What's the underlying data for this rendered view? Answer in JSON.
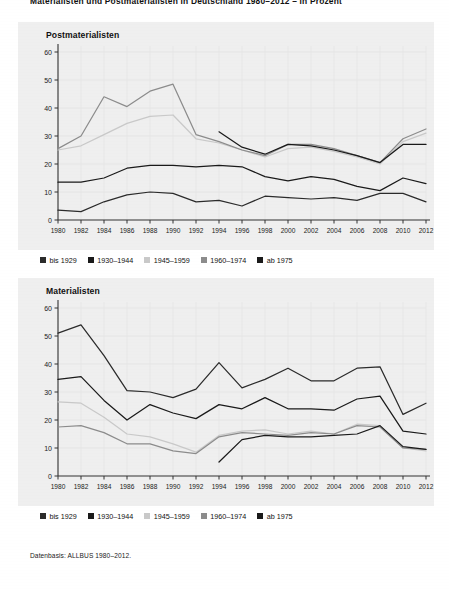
{
  "figure": {
    "title": "Materialisten und Postmaterialisten in Deutschland 1980–2012 – in Prozent",
    "source": "Datenbasis: ALLBUS 1980–2012."
  },
  "legend": {
    "items": [
      {
        "label": "bis 1929",
        "color": "#2b2b2b"
      },
      {
        "label": "1930–1944",
        "color": "#1a1a1a"
      },
      {
        "label": "1945–1959",
        "color": "#c9c9c9"
      },
      {
        "label": "1960–1974",
        "color": "#8c8c8c"
      },
      {
        "label": "ab 1975",
        "color": "#1a1a1a"
      }
    ]
  },
  "chart_data": [
    {
      "type": "line",
      "title": "Postmaterialisten",
      "xlabel": "",
      "ylabel": "",
      "ylim": [
        0,
        60
      ],
      "yticks": [
        0,
        10,
        20,
        30,
        40,
        50,
        60
      ],
      "grid": true,
      "legend_position": "below",
      "x": [
        1980,
        1982,
        1984,
        1986,
        1988,
        1990,
        1992,
        1994,
        1996,
        1998,
        2000,
        2002,
        2004,
        2006,
        2008,
        2010,
        2012
      ],
      "series": [
        {
          "name": "bis 1929",
          "color": "#2b2b2b",
          "values": [
            3.5,
            3.0,
            6.5,
            9.0,
            10.0,
            9.5,
            6.5,
            7.0,
            5.0,
            8.5,
            8.0,
            7.5,
            8.0,
            7.0,
            9.5,
            9.5,
            6.5
          ]
        },
        {
          "name": "1930–1944",
          "color": "#1a1a1a",
          "values": [
            13.5,
            13.5,
            15.0,
            18.5,
            19.5,
            19.5,
            19.0,
            19.5,
            19.0,
            15.5,
            14.0,
            15.5,
            14.5,
            12.0,
            10.5,
            15.0,
            13.0
          ]
        },
        {
          "name": "1945–1959",
          "color": "#c9c9c9",
          "values": [
            25.0,
            26.5,
            30.5,
            34.5,
            37.0,
            37.5,
            29.0,
            27.5,
            25.0,
            22.5,
            25.5,
            26.0,
            24.5,
            22.5,
            20.0,
            28.0,
            31.0
          ]
        },
        {
          "name": "1960–1974",
          "color": "#8c8c8c",
          "values": [
            25.5,
            30.0,
            44.0,
            40.5,
            46.0,
            48.5,
            30.5,
            28.0,
            25.0,
            23.0,
            27.0,
            27.0,
            25.5,
            23.0,
            20.5,
            29.0,
            32.5
          ]
        },
        {
          "name": "ab 1975",
          "color": "#1a1a1a",
          "values": [
            null,
            null,
            null,
            null,
            null,
            null,
            null,
            31.5,
            26.0,
            23.5,
            27.0,
            26.5,
            25.0,
            23.0,
            20.5,
            27.0,
            27.0
          ]
        }
      ]
    },
    {
      "type": "line",
      "title": "Materialisten",
      "xlabel": "",
      "ylabel": "",
      "ylim": [
        0,
        60
      ],
      "yticks": [
        0,
        10,
        20,
        30,
        40,
        50,
        60
      ],
      "grid": true,
      "legend_position": "below",
      "x": [
        1980,
        1982,
        1984,
        1986,
        1988,
        1990,
        1992,
        1994,
        1996,
        1998,
        2000,
        2002,
        2004,
        2006,
        2008,
        2010,
        2012
      ],
      "series": [
        {
          "name": "bis 1929",
          "color": "#2b2b2b",
          "values": [
            51.0,
            54.0,
            43.0,
            30.5,
            30.0,
            28.0,
            31.0,
            40.5,
            31.5,
            34.5,
            38.5,
            34.0,
            34.0,
            38.5,
            39.0,
            22.0,
            26.0
          ]
        },
        {
          "name": "1930–1944",
          "color": "#1a1a1a",
          "values": [
            34.5,
            35.5,
            27.0,
            20.0,
            25.5,
            22.5,
            20.5,
            25.5,
            24.0,
            28.0,
            24.0,
            24.0,
            23.5,
            27.5,
            28.5,
            16.0,
            15.0
          ]
        },
        {
          "name": "1945–1959",
          "color": "#c9c9c9",
          "values": [
            26.5,
            26.0,
            21.0,
            15.0,
            14.0,
            11.5,
            8.5,
            14.5,
            16.0,
            16.5,
            15.0,
            16.0,
            15.0,
            18.5,
            18.0,
            10.0,
            9.0
          ]
        },
        {
          "name": "1960–1974",
          "color": "#8c8c8c",
          "values": [
            17.5,
            18.0,
            15.5,
            11.5,
            11.5,
            9.0,
            8.0,
            14.0,
            15.5,
            15.0,
            14.5,
            15.5,
            15.0,
            18.0,
            17.5,
            10.0,
            9.5
          ]
        },
        {
          "name": "ab 1975",
          "color": "#1a1a1a",
          "values": [
            null,
            null,
            null,
            null,
            null,
            null,
            null,
            5.0,
            13.0,
            14.5,
            14.0,
            14.0,
            14.5,
            15.0,
            18.0,
            10.5,
            9.5
          ]
        }
      ]
    }
  ]
}
